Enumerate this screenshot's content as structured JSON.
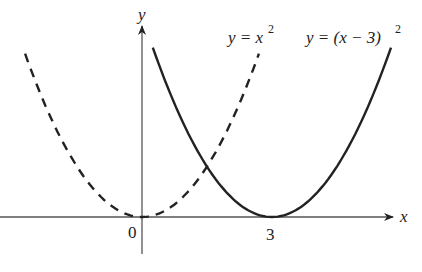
{
  "figure": {
    "type": "function-graph",
    "axes": {
      "x_label": "x",
      "y_label": "y",
      "x_ticks": [
        {
          "value": 0,
          "label": "0"
        },
        {
          "value": 3,
          "label": "3"
        }
      ]
    },
    "curves": [
      {
        "name": "parabola-original",
        "equation": "y = x^2",
        "label_main": "y = x",
        "label_sup": "2",
        "style": "dashed",
        "vertex": [
          0,
          0
        ]
      },
      {
        "name": "parabola-shifted",
        "equation": "y = (x − 3)^2",
        "label_main": "y = (x − 3)",
        "label_sup": "2",
        "style": "solid",
        "vertex": [
          3,
          0
        ]
      }
    ],
    "colors": {
      "ink": "#222222",
      "background": "#ffffff"
    }
  },
  "chart_data": {
    "type": "line",
    "title": "",
    "xlabel": "x",
    "ylabel": "y",
    "x_tick_labels": [
      "0",
      "3"
    ],
    "series": [
      {
        "name": "y = x^2",
        "style": "dashed",
        "x": [
          -2.7,
          -2,
          -1,
          0,
          1,
          2,
          2.7
        ],
        "values": [
          7.29,
          4,
          1,
          0,
          1,
          4,
          7.29
        ]
      },
      {
        "name": "y = (x - 3)^2",
        "style": "solid",
        "x": [
          0.25,
          1,
          2,
          3,
          4,
          5,
          5.75
        ],
        "values": [
          7.56,
          4,
          1,
          0,
          1,
          4,
          7.56
        ]
      }
    ],
    "grid": false,
    "legend": "inline labels"
  }
}
